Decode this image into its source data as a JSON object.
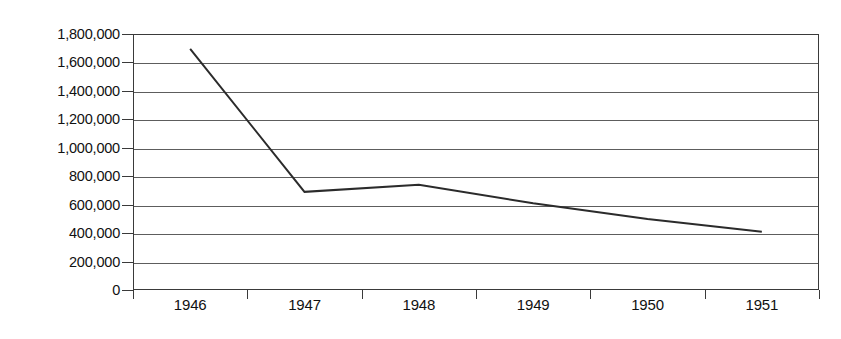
{
  "chart_data": {
    "type": "line",
    "title": "",
    "subtitle": "",
    "xlabel": "",
    "ylabel": "",
    "categories": [
      "1946",
      "1947",
      "1948",
      "1949",
      "1950",
      "1951"
    ],
    "series": [
      {
        "name": "series-1",
        "values": [
          1695000,
          690000,
          740000,
          610000,
          500000,
          410000
        ],
        "color": "#2b2b2b",
        "line_width": 2
      }
    ],
    "ylim": [
      0,
      1800000
    ],
    "y_ticks": [
      0,
      200000,
      400000,
      600000,
      800000,
      1000000,
      1200000,
      1400000,
      1600000,
      1800000
    ],
    "y_tick_labels": [
      "0",
      "200,000",
      "400,000",
      "600,000",
      "800,000",
      "1,000,000",
      "1,200,000",
      "1,400,000",
      "1,600,000",
      "1,800,000"
    ],
    "x_tick_labels": [
      "1946",
      "1947",
      "1948",
      "1949",
      "1950",
      "1951"
    ],
    "grid": {
      "horizontal": true,
      "vertical": false,
      "color": "#5d5d5d"
    },
    "legend": {
      "visible": false,
      "position": "none",
      "entries": []
    },
    "annotations": [],
    "axis_color": "#3a3a3a",
    "background_color": "#ffffff"
  }
}
